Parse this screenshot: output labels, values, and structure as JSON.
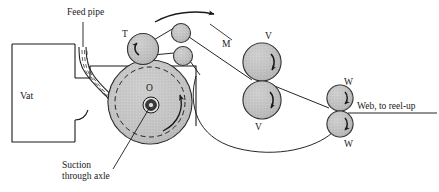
{
  "diagram": {
    "background_color": "#ffffff",
    "ink_color": "#1a1a1a",
    "roll_fill_color": "#bdbdbd",
    "cylinder_fill_color": "#c9c9c9",
    "labels": {
      "feed_pipe": "Feed pipe",
      "vat": "Vat",
      "cylinder_center": "O",
      "suction_line1": "Suction",
      "suction_line2": "through axle",
      "touch_roll": "T",
      "machine_path": "M",
      "press_roll_upper": "V",
      "press_roll_lower": "V",
      "winder_roll_upper": "W",
      "winder_roll_lower": "W",
      "web_outlet": "Web, to reel-up"
    },
    "rollers": [
      {
        "name": "touch-roll-T",
        "label": "T",
        "cx": 143,
        "cy": 49,
        "r": 15.5,
        "rotation": "ccw"
      },
      {
        "name": "guide-roll-upper",
        "label": "",
        "cx": 181,
        "cy": 33,
        "r": 9.5,
        "rotation": ""
      },
      {
        "name": "guide-roll-lower",
        "label": "",
        "cx": 183,
        "cy": 56,
        "r": 9.5,
        "rotation": ""
      },
      {
        "name": "press-roll-V-upper",
        "label": "V",
        "cx": 262,
        "cy": 62,
        "r": 19,
        "rotation": "cw"
      },
      {
        "name": "press-roll-V-lower",
        "label": "V",
        "cx": 262,
        "cy": 100,
        "r": 19,
        "rotation": "cw"
      },
      {
        "name": "winder-roll-W-upper",
        "label": "W",
        "cx": 340,
        "cy": 98,
        "r": 13,
        "rotation": "cw"
      },
      {
        "name": "winder-roll-W-lower",
        "label": "W",
        "cx": 340,
        "cy": 124,
        "r": 13,
        "rotation": "cw"
      }
    ],
    "suction_cylinder": {
      "name": "suction-cylinder",
      "cx": 150,
      "cy": 102,
      "outer_radius": 42,
      "dashed_radius": 35,
      "axle_radius": 8,
      "rotation": "cw"
    },
    "vat": {
      "x": 12,
      "y": 44,
      "width": 63,
      "height": 98
    },
    "direction_arrow": {
      "name": "web-direction-arrow",
      "direction": "right",
      "from_x": 155,
      "to_x": 216,
      "y": 15
    }
  }
}
